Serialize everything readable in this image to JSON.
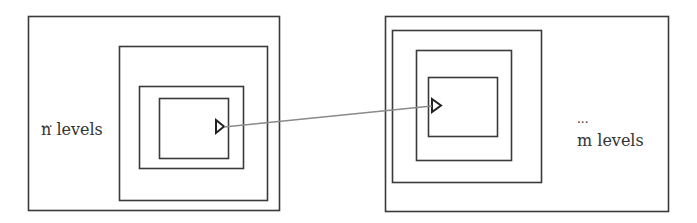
{
  "diagram": {
    "colors": {
      "box_stroke": "#3a3a3a",
      "link_stroke": "#8a8a8a",
      "text": "#333333",
      "background": "#ffffff"
    },
    "left": {
      "ellipsis": "...",
      "label": "n levels",
      "boxes": [
        {
          "x": 28,
          "y": 16,
          "w": 251,
          "h": 194
        },
        {
          "x": 119,
          "y": 46,
          "w": 148,
          "h": 154
        },
        {
          "x": 139,
          "y": 86,
          "w": 104,
          "h": 82
        },
        {
          "x": 159,
          "y": 98,
          "w": 69,
          "h": 60
        }
      ],
      "port": {
        "direction": "right",
        "x": 216,
        "y": 120,
        "w": 8,
        "h": 13
      }
    },
    "right": {
      "ellipsis": "...",
      "label": "m levels",
      "boxes": [
        {
          "x": 385,
          "y": 16,
          "w": 283,
          "h": 195
        },
        {
          "x": 392,
          "y": 30,
          "w": 149,
          "h": 152
        },
        {
          "x": 416,
          "y": 50,
          "w": 95,
          "h": 110
        },
        {
          "x": 428,
          "y": 77,
          "w": 69,
          "h": 59
        }
      ],
      "port": {
        "direction": "right",
        "x": 432,
        "y": 99,
        "w": 9,
        "h": 13
      }
    },
    "link": {
      "from": {
        "x": 224,
        "y": 127
      },
      "to": {
        "x": 432,
        "y": 106
      }
    }
  }
}
